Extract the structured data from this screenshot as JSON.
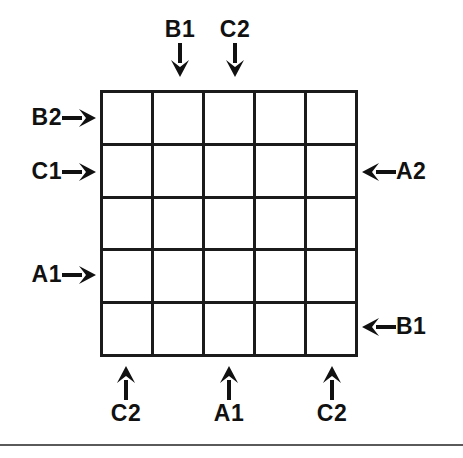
{
  "figure": {
    "grid": {
      "rows": 5,
      "columns": 5,
      "cells_empty": true,
      "line_color": "#1b1b1b",
      "fill_color": "#ffffff"
    },
    "background_color": "#ffffff",
    "text_color": "#111111"
  },
  "labels": {
    "top": [
      {
        "text": "B1",
        "icon": "arrow-down-icon",
        "column": 2
      },
      {
        "text": "C2",
        "icon": "arrow-down-icon",
        "column": 3
      }
    ],
    "left": [
      {
        "text": "B2",
        "icon": "arrow-right-icon",
        "row": 1
      },
      {
        "text": "C1",
        "icon": "arrow-right-icon",
        "row": 2
      },
      {
        "text": "A1",
        "icon": "arrow-right-icon",
        "row": 4
      }
    ],
    "right": [
      {
        "text": "A2",
        "icon": "arrow-left-icon",
        "row": 2
      },
      {
        "text": "B1",
        "icon": "arrow-left-icon",
        "row": 5
      }
    ],
    "bottom": [
      {
        "text": "C2",
        "icon": "arrow-up-icon",
        "column": 1
      },
      {
        "text": "A1",
        "icon": "arrow-up-icon",
        "column": 3
      },
      {
        "text": "C2",
        "icon": "arrow-up-icon",
        "column": 5
      }
    ]
  }
}
